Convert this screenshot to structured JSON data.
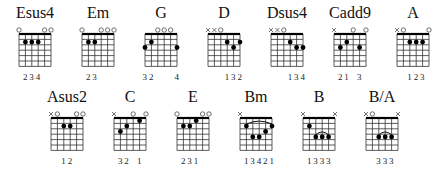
{
  "chords": [
    {
      "name": "Esus4",
      "strings": [
        "o",
        0,
        0,
        0,
        "o",
        "o"
      ],
      "frets": [
        0,
        2,
        2,
        2,
        0,
        0
      ],
      "fingers": [
        "",
        "2",
        "3",
        "4",
        "",
        ""
      ],
      "barre": null
    },
    {
      "name": "Em",
      "strings": [
        "o",
        0,
        0,
        "o",
        "o",
        "o"
      ],
      "frets": [
        0,
        2,
        2,
        0,
        0,
        0
      ],
      "fingers": [
        "",
        "2",
        "3",
        "",
        "",
        ""
      ],
      "barre": null
    },
    {
      "name": "G",
      "strings": [
        0,
        0,
        "o",
        "o",
        "o",
        0
      ],
      "frets": [
        3,
        2,
        0,
        0,
        0,
        3
      ],
      "fingers": [
        "3",
        "2",
        "",
        "",
        "",
        "4"
      ],
      "barre": null
    },
    {
      "name": "D",
      "strings": [
        "x",
        "x",
        "o",
        0,
        0,
        0
      ],
      "frets": [
        -1,
        -1,
        0,
        2,
        3,
        2
      ],
      "fingers": [
        "",
        "",
        "",
        "1",
        "3",
        "2"
      ],
      "barre": null
    },
    {
      "name": "Dsus4",
      "strings": [
        "x",
        "x",
        "o",
        0,
        0,
        0
      ],
      "frets": [
        -1,
        -1,
        0,
        2,
        3,
        3
      ],
      "fingers": [
        "",
        "",
        "",
        "1",
        "3",
        "4"
      ],
      "barre": null
    },
    {
      "name": "Cadd9",
      "strings": [
        "x",
        0,
        0,
        "o",
        0,
        "o"
      ],
      "frets": [
        -1,
        3,
        2,
        0,
        3,
        0
      ],
      "fingers": [
        "",
        "2",
        "1",
        "",
        "3",
        ""
      ],
      "barre": null
    },
    {
      "name": "A",
      "strings": [
        "x",
        "o",
        0,
        0,
        0,
        "o"
      ],
      "frets": [
        -1,
        0,
        2,
        2,
        2,
        0
      ],
      "fingers": [
        "",
        "",
        "1",
        "2",
        "3",
        ""
      ],
      "barre": null
    },
    {
      "name": "Asus2",
      "strings": [
        "x",
        "o",
        0,
        0,
        "o",
        "o"
      ],
      "frets": [
        -1,
        0,
        2,
        2,
        0,
        0
      ],
      "fingers": [
        "",
        "",
        "1",
        "2",
        "",
        ""
      ],
      "barre": null
    },
    {
      "name": "C",
      "strings": [
        "x",
        0,
        0,
        "o",
        0,
        "o"
      ],
      "frets": [
        -1,
        3,
        2,
        0,
        1,
        0
      ],
      "fingers": [
        "",
        "3",
        "2",
        "",
        "1",
        ""
      ],
      "barre": null
    },
    {
      "name": "E",
      "strings": [
        "o",
        0,
        0,
        0,
        "o",
        "o"
      ],
      "frets": [
        0,
        2,
        2,
        1,
        0,
        0
      ],
      "fingers": [
        "",
        "2",
        "3",
        "1",
        "",
        ""
      ],
      "barre": null
    },
    {
      "name": "Bm",
      "strings": [
        "x",
        0,
        0,
        0,
        0,
        0
      ],
      "frets": [
        -1,
        2,
        4,
        4,
        3,
        2
      ],
      "fingers": [
        "",
        "1",
        "3",
        "4",
        "2",
        "1"
      ],
      "barre": {
        "fret": 2,
        "from": 1,
        "to": 5
      }
    },
    {
      "name": "B",
      "strings": [
        "x",
        0,
        0,
        0,
        0,
        "x"
      ],
      "frets": [
        -1,
        2,
        4,
        4,
        4,
        -1
      ],
      "fingers": [
        "",
        "1",
        "3",
        "3",
        "3",
        ""
      ],
      "barre": {
        "fret": 4,
        "from": 2,
        "to": 4
      }
    },
    {
      "name": "B/A",
      "strings": [
        "x",
        "o",
        0,
        0,
        0,
        "x"
      ],
      "frets": [
        -1,
        0,
        4,
        4,
        4,
        -1
      ],
      "fingers": [
        "",
        "",
        "3",
        "3",
        "3",
        ""
      ],
      "barre": {
        "fret": 4,
        "from": 2,
        "to": 4
      }
    }
  ],
  "layout": {
    "row1_y": 4,
    "row2_y": 88,
    "row1_x": [
      5,
      68,
      131,
      194,
      257,
      320,
      383
    ],
    "row2_x": [
      37,
      100,
      163,
      226,
      289,
      352
    ]
  }
}
